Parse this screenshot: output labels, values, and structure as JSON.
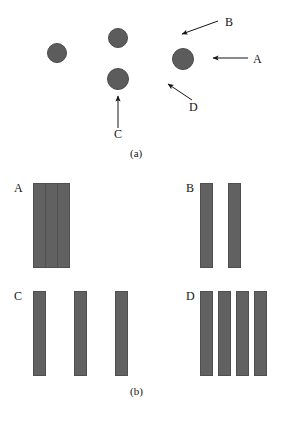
{
  "figure": {
    "caption_a": "(a)",
    "caption_b": "(b)",
    "colors": {
      "shape_fill": "#5c5c5c",
      "bar_fill": "#616161",
      "outline": "#4f4f4f",
      "text": "#141414",
      "background": "#ffffff"
    }
  },
  "panel_a": {
    "name": "circles-with-callouts",
    "circles": [
      {
        "id": "circle-left",
        "cx": 57,
        "cy": 53,
        "r": 10
      },
      {
        "id": "circle-top-middle",
        "cx": 118,
        "cy": 38,
        "r": 10
      },
      {
        "id": "circle-bottom-middle",
        "cx": 118,
        "cy": 79,
        "r": 11
      },
      {
        "id": "circle-right",
        "cx": 183,
        "cy": 59,
        "r": 11
      }
    ],
    "callouts": [
      {
        "label": "B",
        "label_x": 225,
        "label_y": 16,
        "x1": 218,
        "y1": 21,
        "x2": 182,
        "y2": 34
      },
      {
        "label": "A",
        "label_x": 253,
        "label_y": 53,
        "x1": 248,
        "y1": 58,
        "x2": 213,
        "y2": 58
      },
      {
        "label": "D",
        "label_x": 189,
        "label_y": 101,
        "x1": 192,
        "y1": 100,
        "x2": 168,
        "y2": 84
      },
      {
        "label": "C",
        "label_x": 114,
        "label_y": 128,
        "x1": 118,
        "y1": 128,
        "x2": 118,
        "y2": 96
      }
    ]
  },
  "panel_b": {
    "name": "bar-groups",
    "groups": [
      {
        "label": "A",
        "label_x": 14,
        "label_y": 182,
        "description": "three adjacent touching bars",
        "bars": [
          {
            "x": 33,
            "y": 183,
            "w": 13,
            "h": 85
          },
          {
            "x": 45,
            "y": 183,
            "w": 13,
            "h": 85
          },
          {
            "x": 57,
            "y": 183,
            "w": 13,
            "h": 85
          }
        ]
      },
      {
        "label": "B",
        "label_x": 186,
        "label_y": 182,
        "description": "two widely separated bars",
        "bars": [
          {
            "x": 200,
            "y": 183,
            "w": 13,
            "h": 85
          },
          {
            "x": 228,
            "y": 183,
            "w": 13,
            "h": 85
          }
        ]
      },
      {
        "label": "C",
        "label_x": 14,
        "label_y": 290,
        "description": "three widely separated bars",
        "bars": [
          {
            "x": 33,
            "y": 291,
            "w": 13,
            "h": 85
          },
          {
            "x": 74,
            "y": 291,
            "w": 13,
            "h": 85
          },
          {
            "x": 115,
            "y": 291,
            "w": 13,
            "h": 85
          }
        ]
      },
      {
        "label": "D",
        "label_x": 186,
        "label_y": 290,
        "description": "four closely spaced bars",
        "bars": [
          {
            "x": 200,
            "y": 291,
            "w": 13,
            "h": 85
          },
          {
            "x": 218,
            "y": 291,
            "w": 13,
            "h": 85
          },
          {
            "x": 236,
            "y": 291,
            "w": 13,
            "h": 85
          },
          {
            "x": 254,
            "y": 291,
            "w": 13,
            "h": 85
          }
        ]
      }
    ]
  },
  "captions": [
    {
      "text": "(a)",
      "x": 130,
      "y": 148
    },
    {
      "text": "(b)",
      "x": 130,
      "y": 386
    }
  ]
}
